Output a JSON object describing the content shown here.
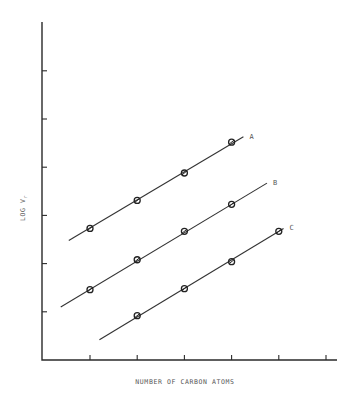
{
  "chart_data": {
    "type": "line",
    "title": "",
    "xlabel": "NUMBER OF CARBON ATOMS",
    "ylabel": "LOG V_r",
    "ylabel_main": "LOG V",
    "ylabel_sub": "r",
    "xlim": [
      0,
      6.3
    ],
    "ylim": [
      0,
      7
    ],
    "x_ticks": [
      1,
      2,
      3,
      4,
      5,
      6
    ],
    "y_ticks": [
      1,
      2,
      3,
      4,
      5,
      6
    ],
    "tick_labels_shown": false,
    "grid": false,
    "legend": "inline labels at line ends",
    "marker": "open circle with slash",
    "series": [
      {
        "name": "A",
        "x": [
          1,
          2,
          3,
          4
        ],
        "values": [
          2.73,
          3.31,
          3.88,
          4.52
        ],
        "fit_line": {
          "x": [
            0.55,
            4.25
          ],
          "y": [
            2.48,
            4.63
          ]
        }
      },
      {
        "name": "B",
        "x": [
          1,
          2,
          3,
          4
        ],
        "values": [
          1.46,
          2.08,
          2.67,
          3.23
        ],
        "fit_line": {
          "x": [
            0.38,
            4.75
          ],
          "y": [
            1.1,
            3.67
          ]
        }
      },
      {
        "name": "C",
        "x": [
          2,
          3,
          4,
          5
        ],
        "values": [
          0.92,
          1.48,
          2.04,
          2.67
        ],
        "fit_line": {
          "x": [
            1.2,
            5.1
          ],
          "y": [
            0.42,
            2.73
          ]
        }
      }
    ]
  },
  "layout": {
    "plot_px": {
      "x0": 42,
      "y0": 360,
      "x_top": 22,
      "x_right": 337,
      "px_per_x": 47.2,
      "px_per_y": 48.2,
      "x_origin_px": 42.8
    }
  }
}
